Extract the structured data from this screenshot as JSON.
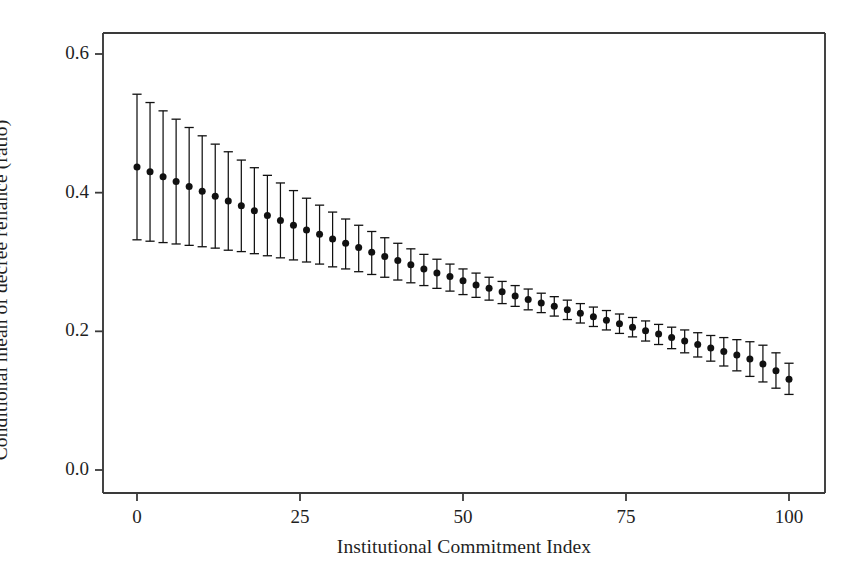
{
  "chart_data": {
    "type": "line",
    "title": "",
    "subtitle": "",
    "xlabel": "Institutional Commitment Index",
    "ylabel": "Conditional mean of decree reliance (ratio)",
    "xlim": [
      -4,
      106
    ],
    "ylim": [
      0.0,
      0.64
    ],
    "xticks": [
      0,
      25,
      50,
      75,
      100
    ],
    "xtick_labels": [
      "0",
      "25",
      "50",
      "75",
      "100"
    ],
    "yticks": [
      0.0,
      0.2,
      0.4,
      0.6
    ],
    "ytick_labels": [
      "0.0",
      "0.2",
      "0.4",
      "0.6"
    ],
    "grid": false,
    "legend": null,
    "legend_position": "none",
    "marker": "filled-circle",
    "errorbar_style": "capped-vertical",
    "series": [
      {
        "name": "Conditional mean of decree reliance",
        "x": [
          0,
          2,
          4,
          6,
          8,
          10,
          12,
          14,
          16,
          18,
          20,
          22,
          24,
          26,
          28,
          30,
          32,
          34,
          36,
          38,
          40,
          42,
          44,
          46,
          48,
          50,
          52,
          54,
          56,
          58,
          60,
          62,
          64,
          66,
          68,
          70,
          72,
          74,
          76,
          78,
          80,
          82,
          84,
          86,
          88,
          90,
          92,
          94,
          96,
          98,
          100
        ],
        "values": [
          0.437,
          0.43,
          0.423,
          0.416,
          0.409,
          0.402,
          0.395,
          0.388,
          0.381,
          0.374,
          0.367,
          0.36,
          0.353,
          0.346,
          0.34,
          0.333,
          0.327,
          0.321,
          0.314,
          0.308,
          0.302,
          0.296,
          0.29,
          0.284,
          0.279,
          0.273,
          0.267,
          0.262,
          0.257,
          0.251,
          0.246,
          0.241,
          0.236,
          0.231,
          0.226,
          0.221,
          0.216,
          0.211,
          0.206,
          0.201,
          0.196,
          0.191,
          0.186,
          0.181,
          0.176,
          0.171,
          0.166,
          0.16,
          0.153,
          0.143,
          0.131
        ],
        "ci_lower": [
          0.332,
          0.33,
          0.328,
          0.326,
          0.324,
          0.322,
          0.32,
          0.317,
          0.315,
          0.312,
          0.309,
          0.306,
          0.303,
          0.3,
          0.297,
          0.293,
          0.29,
          0.286,
          0.282,
          0.278,
          0.274,
          0.27,
          0.266,
          0.262,
          0.258,
          0.253,
          0.249,
          0.245,
          0.24,
          0.236,
          0.231,
          0.227,
          0.222,
          0.217,
          0.212,
          0.207,
          0.202,
          0.197,
          0.192,
          0.186,
          0.181,
          0.175,
          0.169,
          0.163,
          0.157,
          0.15,
          0.143,
          0.135,
          0.127,
          0.118,
          0.109
        ],
        "ci_upper": [
          0.542,
          0.53,
          0.518,
          0.506,
          0.494,
          0.482,
          0.47,
          0.459,
          0.447,
          0.436,
          0.425,
          0.414,
          0.403,
          0.392,
          0.382,
          0.372,
          0.362,
          0.353,
          0.344,
          0.335,
          0.327,
          0.319,
          0.311,
          0.304,
          0.297,
          0.29,
          0.284,
          0.278,
          0.272,
          0.266,
          0.261,
          0.255,
          0.25,
          0.245,
          0.24,
          0.235,
          0.23,
          0.225,
          0.22,
          0.215,
          0.21,
          0.206,
          0.202,
          0.198,
          0.194,
          0.191,
          0.188,
          0.185,
          0.18,
          0.169,
          0.154
        ]
      }
    ],
    "colors": {
      "marker": "#111111",
      "errorbar": "#111111",
      "axis": "#3a3a3a",
      "background": "#ffffff"
    }
  }
}
